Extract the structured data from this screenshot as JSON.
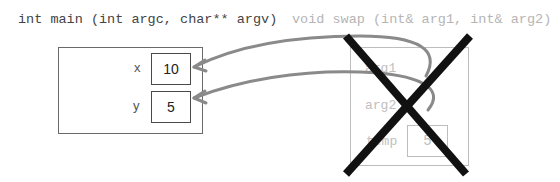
{
  "main_function": {
    "signature": "int main (int argc, char** argv)",
    "variables": [
      {
        "name": "x",
        "value": "10"
      },
      {
        "name": "y",
        "value": "5"
      }
    ]
  },
  "swap_function": {
    "signature": "void swap (int& arg1, int& arg2)",
    "crossed_out": true,
    "parameters": [
      {
        "name": "arg1",
        "refers_to": "x"
      },
      {
        "name": "arg2",
        "refers_to": "y"
      }
    ],
    "locals": [
      {
        "name": "temp",
        "value": "5"
      }
    ]
  },
  "colors": {
    "arrow": "#8a8a8a",
    "cross": "#111111",
    "faded": "#bdbdbd"
  }
}
